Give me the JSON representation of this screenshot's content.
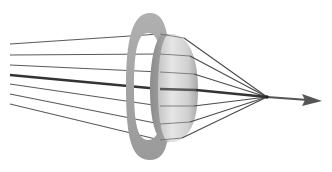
{
  "figure": {
    "type": "optics-diagram",
    "caption_fragment": "",
    "colors": {
      "background": "#ffffff",
      "ray": "#555555",
      "principal_ray": "#333333",
      "aperture": "#a8a8a8",
      "lens_light": "#e2e2e2",
      "lens_dark": "#9c9c9c"
    },
    "focal_point": {
      "x": 267,
      "y": 97
    },
    "arrow_tip": {
      "x": 322,
      "y": 101
    },
    "rays": [
      {
        "start_y": 44,
        "lens_y": 34
      },
      {
        "start_y": 55,
        "lens_y": 54
      },
      {
        "start_y": 65,
        "lens_y": 72
      },
      {
        "start_y": 84,
        "lens_y": 106
      },
      {
        "start_y": 94,
        "lens_y": 124
      },
      {
        "start_y": 104,
        "lens_y": 140
      }
    ],
    "principal_ray": {
      "start_y": 75,
      "lens_y": 89
    }
  }
}
